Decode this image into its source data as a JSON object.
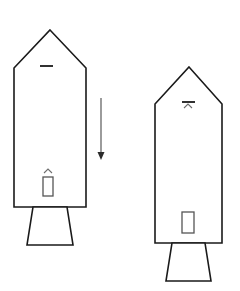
{
  "figure": {
    "background_color": "#ffffff",
    "line_color": "#1a1a1a",
    "accent_color": "#555555",
    "width": 240,
    "height": 291
  },
  "objects": {
    "left_rocket": {
      "label": "Left rocket",
      "body": {
        "label": "Left rocket body",
        "apex_x": 50,
        "apex_y": 30,
        "shoulder_y": 68,
        "left_x": 14,
        "right_x": 86,
        "base_y": 207
      },
      "nozzle": {
        "label": "Left rocket nozzle",
        "top_left_x": 33,
        "top_right_x": 67,
        "top_y": 207,
        "bottom_left_x": 27,
        "bottom_right_x": 73,
        "bottom_y": 245
      },
      "top_mark": {
        "label": "Upper hatch dash",
        "type": "dash",
        "x1": 40,
        "x2": 53,
        "y": 66
      },
      "lower_caret": {
        "label": "Lower caret marker",
        "type": "caret",
        "center_x": 48,
        "y": 173,
        "half_width": 4,
        "height": 4
      },
      "port": {
        "label": "Lower port rectangle",
        "x": 43,
        "y": 177,
        "width": 10,
        "height": 19
      }
    },
    "right_rocket": {
      "label": "Right rocket",
      "body": {
        "label": "Right rocket body",
        "apex_x": 189,
        "apex_y": 67,
        "shoulder_y": 104,
        "left_x": 155,
        "right_x": 222,
        "base_y": 243
      },
      "nozzle": {
        "label": "Right rocket nozzle",
        "top_left_x": 172,
        "top_right_x": 205,
        "top_y": 243,
        "bottom_left_x": 166,
        "bottom_right_x": 211,
        "bottom_y": 281
      },
      "top_mark": {
        "label": "Upper hatch dash",
        "type": "dash",
        "x1": 182,
        "x2": 195,
        "y": 102
      },
      "top_caret": {
        "label": "Upper caret marker",
        "type": "caret",
        "center_x": 188,
        "y": 108,
        "half_width": 4,
        "height": 4
      },
      "port": {
        "label": "Lower port rectangle",
        "x": 182,
        "y": 212,
        "width": 12,
        "height": 21
      }
    },
    "arrow": {
      "label": "Downward transition arrow",
      "direction": "down",
      "x": 101,
      "y_start": 98,
      "y_end": 160,
      "head_half_width": 3.5,
      "head_height": 8
    }
  }
}
